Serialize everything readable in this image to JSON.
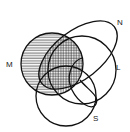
{
  "diagram": {
    "type": "venn",
    "sets": [
      {
        "id": "M",
        "label": "M",
        "shape": "circle",
        "shading": "horizontal-hatch"
      },
      {
        "id": "N",
        "label": "N",
        "shape": "ellipse"
      },
      {
        "id": "L",
        "label": "L",
        "shape": "circle"
      },
      {
        "id": "S",
        "label": "S",
        "shape": "circle"
      }
    ],
    "shaded_regions": [
      {
        "region": "M only",
        "pattern": "horizontal lines"
      },
      {
        "region": "M ∩ N",
        "pattern": "cross-hatch"
      },
      {
        "region": "M ∩ L",
        "pattern": "vertical lines"
      }
    ],
    "colors": {
      "stroke": "#111111",
      "background": "#ffffff"
    }
  }
}
